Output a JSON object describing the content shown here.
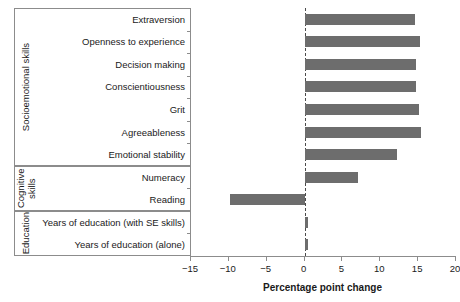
{
  "chart_data": {
    "type": "bar",
    "orientation": "horizontal",
    "title": "",
    "xlabel": "Percentage point change",
    "ylabel": "",
    "xlim": [
      -15,
      20
    ],
    "xticks": [
      -15,
      -10,
      -5,
      0,
      5,
      10,
      15,
      20
    ],
    "xticklabels": [
      "−15",
      "−10",
      "−5",
      "0",
      "5",
      "10",
      "15",
      "20"
    ],
    "grid": false,
    "legend": null,
    "zero_reference_line": 0,
    "bar_color": "#6d6d6d",
    "axis_color": "#8c8c8c",
    "categories": [
      "Extraversion",
      "Openness to experience",
      "Decision making",
      "Conscientiousness",
      "Grit",
      "Agreeableness",
      "Emotional stability",
      "Numeracy",
      "Reading",
      "Years of education (with SE skills)",
      "Years of education (alone)"
    ],
    "values": [
      14.6,
      15.2,
      14.7,
      14.7,
      15.1,
      15.4,
      12.2,
      7.1,
      -9.9,
      0.4,
      0.4
    ],
    "groups": [
      {
        "label": "Socioemotional skills",
        "categories": [
          "Extraversion",
          "Openness to experience",
          "Decision making",
          "Conscientiousness",
          "Grit",
          "Agreeableness",
          "Emotional stability"
        ]
      },
      {
        "label": "Cognitive skills",
        "categories": [
          "Numeracy",
          "Reading"
        ]
      },
      {
        "label": "Education",
        "categories": [
          "Years of education (with SE skills)",
          "Years of education (alone)"
        ]
      }
    ]
  }
}
